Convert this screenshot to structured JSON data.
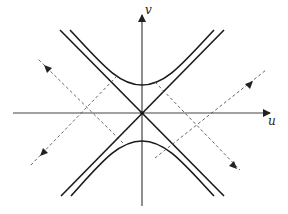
{
  "diagram": {
    "type": "hyperbola-characteristics",
    "axes": {
      "horizontal_label": "u",
      "vertical_label": "v"
    },
    "elements": [
      {
        "name": "asymptote",
        "count": 2,
        "style": "solid"
      },
      {
        "name": "hyperbola-branch",
        "count": 2,
        "style": "solid",
        "orientation": "opens along v"
      },
      {
        "name": "characteristic-line",
        "count": 4,
        "style": "dashed",
        "arrows": true
      }
    ],
    "colors": {
      "stroke": "#1a1a1a",
      "axis": "#444444",
      "dashed": "#555555",
      "background": "#ffffff"
    }
  }
}
